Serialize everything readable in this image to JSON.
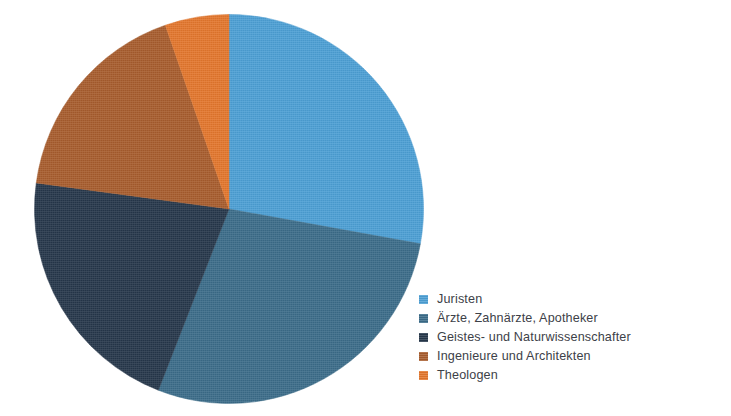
{
  "chart_data": {
    "type": "pie",
    "title": "",
    "subtitle": "",
    "xlabel": "",
    "ylabel": "",
    "grid": false,
    "legend_position": "right-bottom",
    "start_angle_deg": 0,
    "direction": "clockwise",
    "categories": [
      "Juristen",
      "Ärzte, Zahnärzte, Apotheker",
      "Geistes- und Naturwissenschafter",
      "Ingenieure und Architekten",
      "Theologen"
    ],
    "values": [
      27.9,
      28.1,
      21.2,
      17.6,
      5.3
    ],
    "angles_deg": [
      100.3,
      101.0,
      76.4,
      63.2,
      19.1
    ],
    "colors": [
      "#4c9fd4",
      "#3b6c89",
      "#26374a",
      "#a75c2d",
      "#e3762c"
    ],
    "slices": [
      {
        "label": "Juristen",
        "value": 27.9,
        "angle_deg": 100.3,
        "color": "#4c9fd4"
      },
      {
        "label": "Ärzte, Zahnärzte, Apotheker",
        "value": 28.1,
        "angle_deg": 101.0,
        "color": "#3b6c89"
      },
      {
        "label": "Geistes- und Naturwissenschafter",
        "value": 21.2,
        "angle_deg": 76.4,
        "color": "#26374a"
      },
      {
        "label": "Ingenieure und Architekten",
        "value": 17.6,
        "angle_deg": 63.2,
        "color": "#a75c2d"
      },
      {
        "label": "Theologen",
        "value": 5.3,
        "angle_deg": 19.1,
        "color": "#e3762c"
      }
    ]
  },
  "legend": {
    "items": [
      {
        "label": "Juristen",
        "color": "#4c9fd4",
        "swatch_name": "legend-swatch-juristen"
      },
      {
        "label": "Ärzte, Zahnärzte, Apotheker",
        "color": "#3b6c89",
        "swatch_name": "legend-swatch-aerzte"
      },
      {
        "label": "Geistes- und Naturwissenschafter",
        "color": "#26374a",
        "swatch_name": "legend-swatch-geistes"
      },
      {
        "label": "Ingenieure und Architekten",
        "color": "#a75c2d",
        "swatch_name": "legend-swatch-ingenieure"
      },
      {
        "label": "Theologen",
        "color": "#e3762c",
        "swatch_name": "legend-swatch-theologen"
      }
    ]
  },
  "colors": {
    "background": "#ffffff",
    "text": "#3d4148"
  }
}
